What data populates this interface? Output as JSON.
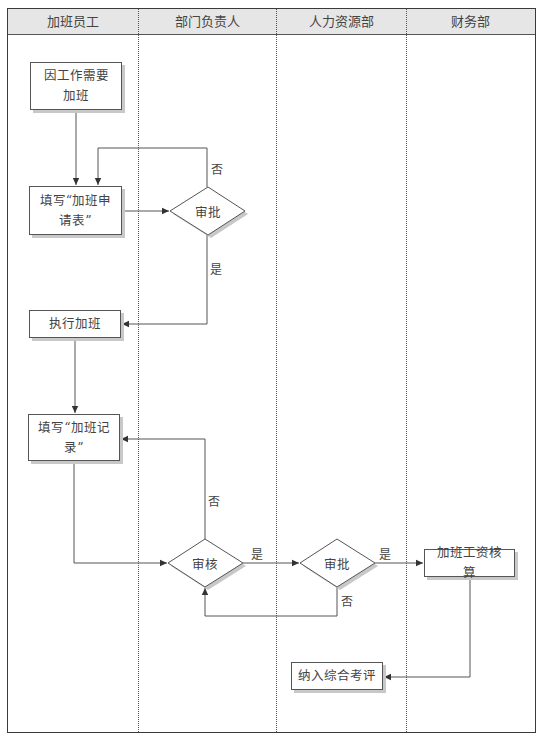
{
  "lanes": [
    {
      "title": "加班员工"
    },
    {
      "title": "部门负责人"
    },
    {
      "title": "人力资源部"
    },
    {
      "title": "财务部"
    }
  ],
  "nodes": {
    "start": {
      "label": "因工作需要加班",
      "line1": "因工作需要",
      "line2": "加班"
    },
    "fill_application": {
      "label": "填写“加班申请表”",
      "line1": "填写“加班申",
      "line2": "请表”"
    },
    "dept_approve": {
      "label": "审批"
    },
    "do_overtime": {
      "label": "执行加班"
    },
    "fill_record": {
      "label": "填写“加班记录”",
      "line1": "填写“加班记",
      "line2": "录”"
    },
    "dept_review": {
      "label": "审核"
    },
    "hr_approve": {
      "label": "审批"
    },
    "pay_calc": {
      "label": "加班工资核算"
    },
    "evaluation": {
      "label": "纳入综合考评"
    }
  },
  "edge_labels": {
    "dept_approve_no": "否",
    "dept_approve_yes": "是",
    "dept_review_no": "否",
    "dept_review_yes": "是",
    "hr_approve_yes": "是",
    "hr_approve_no": "否"
  },
  "colors": {
    "line": "#444444",
    "header_bg": "#e6e6e6",
    "shadow": "#c8c8c8"
  }
}
